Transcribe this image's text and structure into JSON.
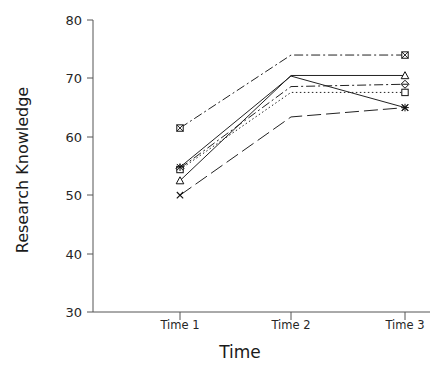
{
  "chart_data": {
    "type": "line",
    "title": "",
    "xlabel": "Time",
    "ylabel": "Research Knowledge",
    "categories": [
      "Time 1",
      "Time 2",
      "Time 3"
    ],
    "ylim": [
      30,
      80
    ],
    "yticks": [
      30,
      40,
      50,
      60,
      70,
      80
    ],
    "ytick_labels": [
      "30",
      "40",
      "50",
      "60",
      "70",
      "80"
    ],
    "grid": false,
    "legend": "none",
    "series": [
      {
        "name": "series-1",
        "marker": "square-x",
        "linestyle": "dash-dot",
        "values": [
          61.5,
          74.0,
          74.0
        ]
      },
      {
        "name": "series-2",
        "marker": "triangle",
        "linestyle": "solid",
        "values": [
          52.5,
          70.5,
          70.5
        ]
      },
      {
        "name": "series-3",
        "marker": "diamond",
        "linestyle": "dash-dot",
        "values": [
          54.6,
          68.6,
          69.0
        ]
      },
      {
        "name": "series-4",
        "marker": "square",
        "linestyle": "dotted",
        "values": [
          54.4,
          67.6,
          67.6
        ]
      },
      {
        "name": "series-5",
        "marker": "asterisk",
        "linestyle": "solid",
        "values": [
          54.8,
          70.4,
          65.0
        ]
      },
      {
        "name": "series-6",
        "marker": "x",
        "linestyle": "long-dash",
        "values": [
          50.0,
          63.4,
          65.0
        ]
      }
    ]
  },
  "axis": {
    "y_label": "Research Knowledge",
    "x_label": "Time",
    "y_ticks": [
      "80",
      "70",
      "60",
      "50",
      "40",
      "30"
    ],
    "x_ticks": [
      "Time 1",
      "Time 2",
      "Time 3"
    ]
  },
  "colors": {
    "line": "#222222",
    "axis": "#555555",
    "text": "#1a1a1a",
    "background": "#ffffff"
  }
}
